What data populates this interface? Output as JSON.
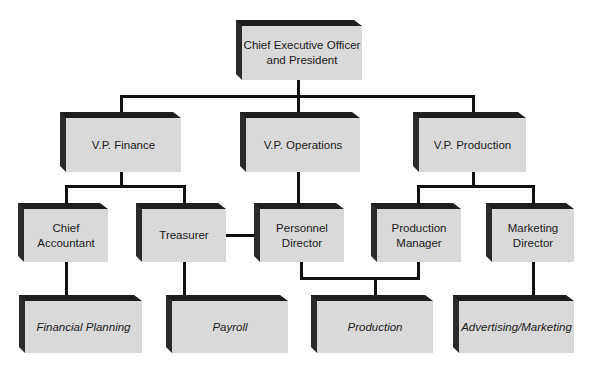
{
  "diagram": {
    "type": "org-chart",
    "nodes": {
      "ceo": {
        "label_line1": "Chief Executive Officer",
        "label_line2": "and President"
      },
      "vp_finance": {
        "label": "V.P. Finance"
      },
      "vp_operations": {
        "label": "V.P. Operations"
      },
      "vp_production": {
        "label": "V.P. Production"
      },
      "chief_accountant": {
        "label_line1": "Chief",
        "label_line2": "Accountant"
      },
      "treasurer": {
        "label": "Treasurer"
      },
      "personnel_director": {
        "label_line1": "Personnel",
        "label_line2": "Director"
      },
      "production_manager": {
        "label_line1": "Production",
        "label_line2": "Manager"
      },
      "marketing_director": {
        "label_line1": "Marketing",
        "label_line2": "Director"
      },
      "financial_planning": {
        "label": "Financial Planning"
      },
      "payroll": {
        "label": "Payroll"
      },
      "production": {
        "label": "Production"
      },
      "advertising_marketing": {
        "label": "Advertising/Marketing"
      }
    },
    "edges": [
      [
        "ceo",
        "vp_finance"
      ],
      [
        "ceo",
        "vp_operations"
      ],
      [
        "ceo",
        "vp_production"
      ],
      [
        "vp_finance",
        "chief_accountant"
      ],
      [
        "vp_finance",
        "treasurer"
      ],
      [
        "vp_operations",
        "personnel_director"
      ],
      [
        "vp_production",
        "production_manager"
      ],
      [
        "vp_production",
        "marketing_director"
      ],
      [
        "treasurer",
        "personnel_director"
      ],
      [
        "chief_accountant",
        "financial_planning"
      ],
      [
        "treasurer",
        "payroll"
      ],
      [
        "personnel_director",
        "production"
      ],
      [
        "production_manager",
        "production"
      ],
      [
        "marketing_director",
        "advertising_marketing"
      ]
    ],
    "colors": {
      "box_face": "#d9d9d9",
      "box_shadow": "#1e1e1e",
      "line": "#111111",
      "background": "#ffffff"
    }
  }
}
